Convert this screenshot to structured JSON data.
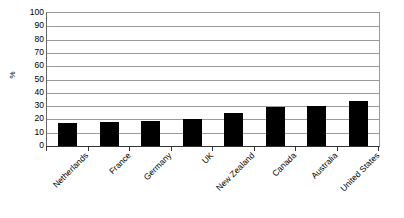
{
  "chart_data": {
    "type": "bar",
    "title": "",
    "subtitle": "",
    "xlabel": "",
    "ylabel": "%",
    "ylim": [
      0,
      100
    ],
    "ytick_step": 10,
    "yticks": [
      100,
      90,
      80,
      70,
      60,
      50,
      40,
      30,
      20,
      10,
      0
    ],
    "ytick_labels": [
      "100",
      "90",
      "80",
      "70",
      "60",
      "50",
      "40",
      "30",
      "20",
      "10",
      "0"
    ],
    "grid": "horizontal",
    "legend": "none",
    "bar_color": "#000000",
    "plot_background": "#ffffff",
    "gridline_color": "#9a9a9a",
    "categories": [
      "Netherlands",
      "France",
      "Germany",
      "UK",
      "New Zealand",
      "Canada",
      "Australia",
      "United States"
    ],
    "values": [
      17,
      18,
      19,
      20,
      25,
      29,
      30,
      34
    ]
  }
}
